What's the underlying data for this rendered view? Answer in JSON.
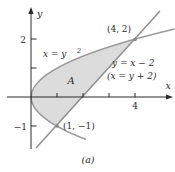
{
  "colors": {
    "curve": "#9a9a9a",
    "line": "#8f8f8f",
    "region_fill": "#dcdcdc",
    "axis": "#2b2b2b",
    "point": "#858585",
    "text": "#2b2b2b",
    "background": "#ffffff"
  },
  "axes": {
    "x_label": "x",
    "y_label": "y"
  },
  "tick_labels": {
    "y_2": "2",
    "y_neg1": "−1",
    "x_4": "4"
  },
  "curves": {
    "parabola": {
      "equation_base": "x = y",
      "equation_exponent": "2"
    },
    "line": {
      "equation_line1": "y = x − 2",
      "equation_line2": "(x = y + 2)"
    }
  },
  "region": {
    "label": "A"
  },
  "points": {
    "upper_intersection": "(4, 2)",
    "lower_intersection": "(1, −1)"
  },
  "caption": "(a)",
  "graph": {
    "type": "function-plot",
    "curves": [
      {
        "name": "parabola",
        "equation": "x = y^2"
      },
      {
        "name": "line",
        "equation": "y = x - 2 (x = y + 2)"
      }
    ],
    "intersections": [
      {
        "x": 4,
        "y": 2
      },
      {
        "x": 1,
        "y": -1
      }
    ],
    "shaded_region": "A: between x = y^2 and y = x - 2 for -1 <= y <= 2",
    "x_ticks_shown": [
      1,
      2,
      3,
      4
    ],
    "y_ticks_shown": [
      -1,
      1,
      2
    ],
    "x_tick_labeled": [
      4
    ],
    "y_tick_labeled": [
      -1,
      2
    ]
  }
}
